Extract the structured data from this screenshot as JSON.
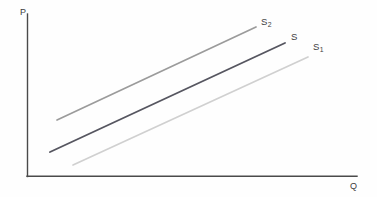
{
  "figure": {
    "background_color": "#fefefe",
    "width": 377,
    "height": 197
  },
  "axes": {
    "y_axis": {
      "label": "P",
      "color": "#4a4a4a",
      "x": 27,
      "y_top": 14,
      "y_bottom": 176
    },
    "x_axis": {
      "label": "Q",
      "color": "#4a4a4a",
      "y": 176,
      "x_left": 27,
      "x_right": 357
    }
  },
  "chart_data": {
    "type": "line",
    "title": "",
    "xlabel": "Q",
    "ylabel": "P",
    "grid": false,
    "legend": "inline-end-labels",
    "xlim": [
      0,
      377
    ],
    "ylim": [
      0,
      197
    ],
    "axis_ticks": {
      "x": [],
      "y": []
    },
    "series": [
      {
        "name": "S2",
        "label": "S",
        "subscript": "2",
        "color": "#9b9b9b",
        "width": 1.7,
        "x": [
          57,
          256
        ],
        "y": [
          120,
          27
        ],
        "label_x": 261,
        "label_y": 17,
        "meaning": "supply curve shifted left (decrease in supply)"
      },
      {
        "name": "S",
        "label": "S",
        "subscript": "",
        "color": "#565660",
        "width": 1.9,
        "x": [
          50,
          285
        ],
        "y": [
          152,
          43
        ],
        "label_x": 291,
        "label_y": 32,
        "meaning": "original supply curve"
      },
      {
        "name": "S1",
        "label": "S",
        "subscript": "1",
        "color": "#d0d0d0",
        "width": 1.7,
        "x": [
          73,
          308
        ],
        "y": [
          165,
          57
        ],
        "label_x": 313,
        "label_y": 42,
        "meaning": "supply curve shifted right (increase in supply)"
      }
    ]
  }
}
